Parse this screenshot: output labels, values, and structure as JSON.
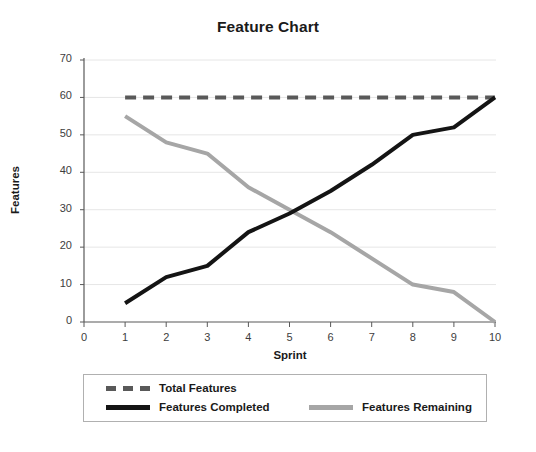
{
  "chart_data": {
    "type": "line",
    "title": "Feature Chart",
    "xlabel": "Sprint",
    "ylabel": "Features",
    "xlim": [
      0,
      10
    ],
    "ylim": [
      0,
      70
    ],
    "xticks": [
      "0",
      "1",
      "2",
      "3",
      "4",
      "5",
      "6",
      "7",
      "8",
      "9",
      "10"
    ],
    "yticks": [
      "0",
      "10",
      "20",
      "30",
      "40",
      "50",
      "60",
      "70"
    ],
    "grid": "horizontal",
    "legend_position": "below-plot",
    "x": [
      1,
      2,
      3,
      4,
      5,
      6,
      7,
      8,
      9,
      10
    ],
    "series": [
      {
        "name": "Total Features",
        "style": "dashed",
        "color": "#595959",
        "width": 4,
        "values": [
          60,
          60,
          60,
          60,
          60,
          60,
          60,
          60,
          60,
          60
        ]
      },
      {
        "name": "Features Completed",
        "style": "solid",
        "color": "#141414",
        "width": 4,
        "values": [
          5,
          12,
          15,
          24,
          29,
          35,
          42,
          50,
          52,
          60
        ]
      },
      {
        "name": "Features Remaining",
        "style": "solid",
        "color": "#a6a6a6",
        "width": 4,
        "values": [
          55,
          48,
          45,
          36,
          30,
          24,
          17,
          10,
          8,
          0
        ]
      }
    ]
  },
  "legend": {
    "items": [
      {
        "label": "Total Features"
      },
      {
        "label": "Features Completed"
      },
      {
        "label": "Features Remaining"
      }
    ]
  },
  "colors": {
    "total": "#595959",
    "completed": "#141414",
    "remaining": "#a6a6a6",
    "axis": "#595959",
    "grid": "#e6e6e6",
    "background": "#ffffff"
  }
}
